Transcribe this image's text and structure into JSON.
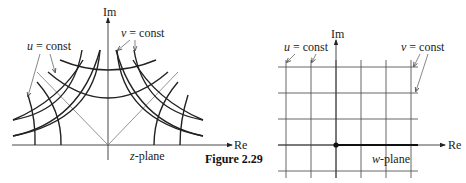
{
  "figure": {
    "caption": "Figure 2.29"
  },
  "z_plane": {
    "axis_re_label": "Re",
    "axis_im_label": "Im",
    "plane_label_var": "z",
    "plane_label_suffix": "-plane",
    "u_label_var": "u",
    "u_label_rest": " = const",
    "v_label_var": "v",
    "v_label_rest": " = const"
  },
  "w_plane": {
    "axis_re_label": "Re",
    "axis_im_label": "Im",
    "plane_label_var": "w",
    "plane_label_suffix": "-plane",
    "u_label_var": "u",
    "u_label_rest": " = const",
    "v_label_var": "v",
    "v_label_rest": " = const",
    "grid_columns": 6,
    "grid_rows": 5
  }
}
